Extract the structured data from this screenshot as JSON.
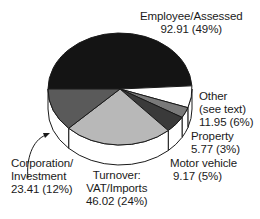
{
  "chart_data": {
    "type": "pie",
    "style": "3d-exploded-none",
    "title": "",
    "units": "",
    "categories": [
      "Employee/Assessed",
      "Other (see text)",
      "Property",
      "Motor vehicle",
      "Turnover: VAT/Imports",
      "Corporation/Investment"
    ],
    "values": [
      92.91,
      11.95,
      5.77,
      9.17,
      46.02,
      23.41
    ],
    "percentages": [
      49,
      6,
      3,
      5,
      24,
      12
    ],
    "colors": [
      "#141414",
      "#ffffff",
      "#7a7a7a",
      "#3a3a3a",
      "#b8b8b8",
      "#5a5a5a"
    ],
    "legend": "none (direct labels)"
  },
  "labels": {
    "employee": {
      "line1": "Employee/Assessed",
      "line2": "92.91 (49%)"
    },
    "other": {
      "line1": "Other",
      "line2": "(see text)",
      "line3": "11.95 (6%)"
    },
    "property": {
      "line1": "Property",
      "line2": "5.77 (3%)"
    },
    "motor": {
      "line1": "Motor vehicle",
      "line2": "9.17 (5%)"
    },
    "turnover": {
      "line1": "Turnover:",
      "line2": "VAT/Imports",
      "line3": "46.02 (24%)"
    },
    "corporation": {
      "line1": "Corporation/",
      "line2": "Investment",
      "line3": "23.41 (12%)"
    }
  }
}
